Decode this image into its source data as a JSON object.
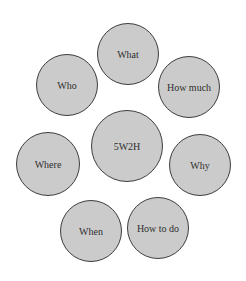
{
  "diagram": {
    "type": "concept-circles",
    "colors": {
      "fill": "#cbcbcb",
      "stroke": "#3e3e3e",
      "text": "#2e2e2e",
      "background": "#ffffff"
    },
    "center": {
      "label": "5W2H",
      "cx": 127,
      "cy": 146,
      "r": 36
    },
    "nodes": [
      {
        "label": "What",
        "cx": 128,
        "cy": 54,
        "r": 31
      },
      {
        "label": "Who",
        "cx": 67,
        "cy": 85,
        "r": 31
      },
      {
        "label": "How much",
        "cx": 189,
        "cy": 87,
        "r": 31
      },
      {
        "label": "Where",
        "cx": 48,
        "cy": 164,
        "r": 32
      },
      {
        "label": "Why",
        "cx": 200,
        "cy": 165,
        "r": 31
      },
      {
        "label": "When",
        "cx": 91,
        "cy": 231,
        "r": 31
      },
      {
        "label": "How to do",
        "cx": 158,
        "cy": 228,
        "r": 31
      }
    ]
  }
}
